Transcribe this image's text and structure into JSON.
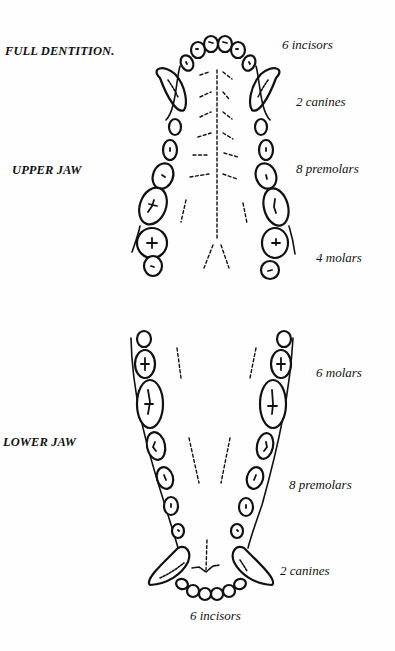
{
  "title": "FULL DENTITION.",
  "upper_jaw": {
    "label": "UPPER JAW",
    "annotations": [
      {
        "count": 6,
        "text": "6 incisors"
      },
      {
        "count": 2,
        "text": "2 canines"
      },
      {
        "count": 8,
        "text": "8 premolars"
      },
      {
        "count": 4,
        "text": "4 molars"
      }
    ]
  },
  "lower_jaw": {
    "label": "LOWER JAW",
    "annotations": [
      {
        "count": 6,
        "text": "6 molars"
      },
      {
        "count": 8,
        "text": "8 premolars"
      },
      {
        "count": 2,
        "text": "2 canines"
      },
      {
        "count": 6,
        "text": "6 incisors"
      }
    ]
  },
  "colors": {
    "ink": "#111111",
    "paper": "#fefefe"
  }
}
